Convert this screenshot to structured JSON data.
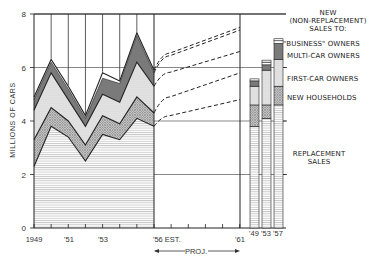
{
  "chart_data": {
    "type": "area",
    "title": "",
    "ylabel": "MILLIONS OF CARS",
    "xlabel": "",
    "ylim": [
      0,
      8
    ],
    "yticks": [
      "0",
      "2",
      "4",
      "6",
      "8"
    ],
    "x": [
      1949,
      1950,
      1951,
      1952,
      1953,
      1954,
      1955,
      1956
    ],
    "xtick_labels": [
      "1949",
      "'51",
      "'53",
      "'56 EST.",
      "'61"
    ],
    "stacked_cumulative": true,
    "series": [
      {
        "name": "REPLACEMENT SALES",
        "values": [
          2.3,
          3.8,
          3.4,
          2.5,
          3.5,
          3.3,
          4.1,
          3.8
        ]
      },
      {
        "name": "NEW HOUSEHOLDS",
        "values": [
          3.3,
          4.5,
          4.0,
          3.1,
          4.2,
          3.9,
          4.9,
          4.3
        ]
      },
      {
        "name": "FIRST-CAR OWNERS",
        "values": [
          4.4,
          5.8,
          4.8,
          3.8,
          5.0,
          4.7,
          6.2,
          5.3
        ]
      },
      {
        "name": "MULTI-CAR OWNERS",
        "values": [
          4.8,
          6.2,
          5.2,
          4.1,
          5.6,
          5.4,
          7.2,
          5.8
        ]
      },
      {
        "name": "\"BUSINESS\" OWNERS",
        "values": [
          4.9,
          6.3,
          5.3,
          4.2,
          5.8,
          5.5,
          7.3,
          5.9
        ]
      }
    ],
    "projection": {
      "label": "PROJ.",
      "from": 1956,
      "to": 1961,
      "lines": [
        {
          "name": "NEW HOUSEHOLDS",
          "start": 3.8,
          "end": 4.8
        },
        {
          "name": "FIRST-CAR OWNERS",
          "start": 4.3,
          "end": 5.8
        },
        {
          "name": "MULTI-CAR OWNERS",
          "start": 5.3,
          "end": 6.6
        },
        {
          "name": "\"BUSINESS\" OWNERS",
          "start": 5.8,
          "end": 7.4
        },
        {
          "name": "TOTAL",
          "start": 5.9,
          "end": 7.5
        }
      ]
    },
    "bars": {
      "categories": [
        "'49",
        "'53",
        "'57"
      ],
      "series": [
        {
          "name": "REPLACEMENT SALES",
          "values": [
            3.8,
            4.1,
            4.6
          ]
        },
        {
          "name": "NEW HOUSEHOLDS",
          "values": [
            4.6,
            4.6,
            5.3
          ]
        },
        {
          "name": "FIRST-CAR OWNERS",
          "values": [
            5.3,
            5.9,
            6.3
          ]
        },
        {
          "name": "MULTI-CAR OWNERS",
          "values": [
            5.5,
            6.1,
            6.9
          ]
        },
        {
          "name": "\"BUSINESS\" OWNERS",
          "values": [
            5.5,
            6.2,
            7.0
          ]
        }
      ]
    },
    "legend": {
      "header": [
        "NEW",
        "(NON-REPLACEMENT)",
        "SALES TO:"
      ],
      "items": [
        "\"BUSINESS\" OWNERS",
        "MULTI-CAR OWNERS",
        "FIRST-CAR OWNERS",
        "NEW HOUSEHOLDS",
        "REPLACEMENT",
        "SALES"
      ]
    },
    "grid": true
  },
  "labels": {
    "ylabel": "MILLIONS OF CARS",
    "legend_new": "NEW",
    "legend_nonrep": "(NON-REPLACEMENT)",
    "legend_salesto": "SALES TO:",
    "legend_business": "\"BUSINESS\" OWNERS",
    "legend_multi": "MULTI-CAR OWNERS",
    "legend_first": "FIRST-CAR OWNERS",
    "legend_households": "NEW HOUSEHOLDS",
    "legend_replacement": "REPLACEMENT",
    "legend_sales": "SALES",
    "x1949": "1949",
    "x51": "'51",
    "x53": "'53",
    "x56": "'56 EST.",
    "x61": "'61",
    "b49": "'49",
    "b53": "'53",
    "b57": "'57",
    "proj": "PROJ.",
    "y0": "0",
    "y2": "2",
    "y4": "4",
    "y6": "6",
    "y8": "8"
  }
}
